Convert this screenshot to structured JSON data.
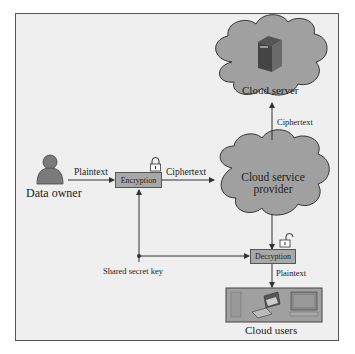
{
  "diagram": {
    "nodes": {
      "data_owner": {
        "label": "Data owner",
        "icon": "person-icon"
      },
      "encryption": {
        "label": "Encryption",
        "icon": "lock-closed-icon"
      },
      "cloud_service_provider": {
        "label_line1": "Cloud service",
        "label_line2": "provider"
      },
      "cloud_server": {
        "label": "Cloud server",
        "icon": "server-icon"
      },
      "decryption": {
        "label": "Decryption",
        "icon": "lock-open-icon"
      },
      "cloud_users": {
        "label": "Cloud users",
        "icons": [
          "phone-icon",
          "laptop-icon",
          "desktop-icon"
        ]
      }
    },
    "edges": {
      "owner_to_encryption": "Plaintext",
      "encryption_to_provider": "Ciphertext",
      "provider_to_server": "Ciphertext",
      "decryption_to_users": "Plaintext",
      "key": "Shared secret key"
    },
    "colors": {
      "background": "#efefef",
      "cloud_fill": "#a0a0a0",
      "box_fill": "#a8a8a8",
      "stroke": "#333333"
    }
  }
}
